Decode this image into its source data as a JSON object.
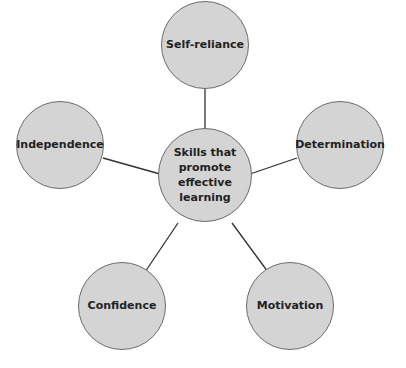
{
  "diagram": {
    "type": "mind-map",
    "center": {
      "label": "Skills that promote effective learning",
      "lines": [
        "Skills that",
        "promote",
        "effective",
        "learning"
      ]
    },
    "nodes": [
      {
        "id": "self-reliance",
        "label": "Self-reliance"
      },
      {
        "id": "determination",
        "label": "Determination"
      },
      {
        "id": "motivation",
        "label": "Motivation"
      },
      {
        "id": "confidence",
        "label": "Confidence"
      },
      {
        "id": "independence",
        "label": "Independence"
      }
    ],
    "colors": {
      "node_fill": "#d4d4d4",
      "node_border": "#6b6b6b",
      "connector": "#333333"
    }
  }
}
